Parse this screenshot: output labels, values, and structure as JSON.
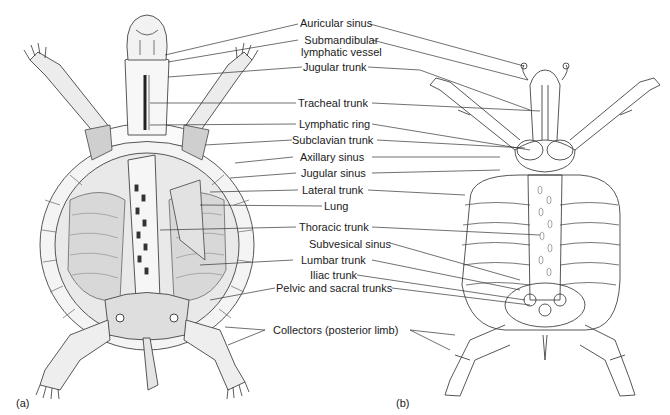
{
  "figure": {
    "panels": [
      {
        "id": "a",
        "tag": "(a)",
        "style": "shaded dissection drawing"
      },
      {
        "id": "b",
        "tag": "(b)",
        "style": "outline schematic"
      }
    ],
    "labels": [
      {
        "id": "auricular-sinus",
        "text": "Auricular sinus",
        "x": 330,
        "y": 18
      },
      {
        "id": "submandibular-lymphatic-vessel",
        "text": "Submandibular",
        "text2": "lymphatic vessel",
        "x": 328,
        "y": 36
      },
      {
        "id": "jugular-trunk",
        "text": "Jugular trunk",
        "x": 333,
        "y": 62
      },
      {
        "id": "tracheal-trunk",
        "text": "Tracheal trunk",
        "x": 332,
        "y": 98
      },
      {
        "id": "lymphatic-ring",
        "text": "Lymphatic ring",
        "x": 333,
        "y": 119
      },
      {
        "id": "subclavian-trunk",
        "text": "Subclavian trunk",
        "x": 333,
        "y": 135
      },
      {
        "id": "axillary-sinus",
        "text": "Axillary sinus",
        "x": 333,
        "y": 152
      },
      {
        "id": "jugular-sinus",
        "text": "Jugular sinus",
        "x": 333,
        "y": 168
      },
      {
        "id": "lateral-trunk",
        "text": "Lateral trunk",
        "x": 333,
        "y": 185
      },
      {
        "id": "lung",
        "text": "Lung",
        "x": 335,
        "y": 201
      },
      {
        "id": "thoracic-trunk",
        "text": "Thoracic trunk",
        "x": 333,
        "y": 222
      },
      {
        "id": "subvesical-sinus",
        "text": "Subvesical sinus",
        "x": 335,
        "y": 239
      },
      {
        "id": "lumbar-trunk",
        "text": "Lumbar trunk",
        "x": 333,
        "y": 255
      },
      {
        "id": "iliac-trunk",
        "text": "Iliac trunk",
        "x": 332,
        "y": 270
      },
      {
        "id": "pelvic-and-sacral-trunks",
        "text": "Pelvic and sacral trunks",
        "x": 332,
        "y": 283
      },
      {
        "id": "collectors-posterior-limb",
        "text": "Collectors (posterior limb)",
        "x": 339,
        "y": 325
      }
    ]
  }
}
